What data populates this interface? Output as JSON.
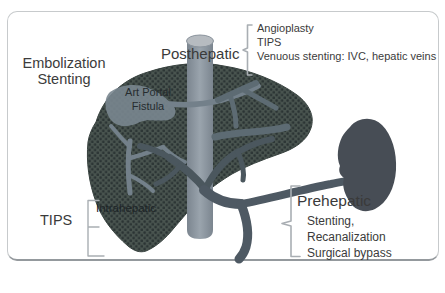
{
  "colors": {
    "background": "#ffffff",
    "frame_border": "#c7cacc",
    "frame_border_bottom": "#94999d",
    "liver_fill": "#49544f",
    "liver_dots": "#2b3434",
    "vena_cava": "#8d97a1",
    "vena_cava_cap": "#b6bbc0",
    "portal_vein": "#4e5963",
    "intrahepatic_vessels_light": "#73808a",
    "intrahepatic_vessels_dark": "#4b575e",
    "spleen": "#474d55",
    "bracket": "#a9aeb3",
    "text": "#3a3a3a"
  },
  "labels": {
    "embolization": {
      "line1": "Embolization",
      "line2": "Stenting"
    },
    "posthepatic": {
      "title": "Posthepatic",
      "items": [
        "Angioplasty",
        "TIPS",
        "Venuous stenting: IVC, hepatic veins"
      ]
    },
    "fistula": {
      "line1": "Art Portal",
      "line2": "Fistula"
    },
    "tips": "TIPS",
    "intrahepatic": "Intrahepatic",
    "prehepatic": {
      "title": "Prehepatic",
      "items": [
        "Stenting,",
        "Recanalization",
        "Surgical bypass"
      ]
    }
  }
}
